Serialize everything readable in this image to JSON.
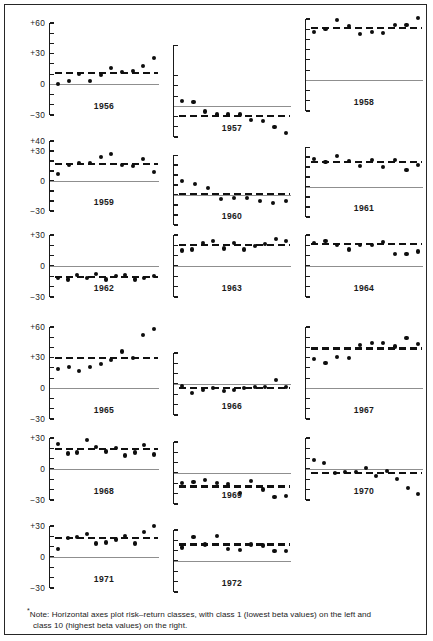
{
  "figure": {
    "footnote_marker": "*",
    "footnote_line1": "Note:  Horizontal axes plot risk–return classes, with class 1 (lowest beta values) on the left and",
    "footnote_line2": "class 10 (highest beta values) on the right.",
    "border_color": "#262626",
    "dot_color": "#0d0d0d",
    "mean_line_color": "#111111",
    "zero_line_color": "#8f8f8f"
  },
  "chart_data": {
    "type": "scatter",
    "title": "",
    "subtitle": "",
    "xlabel": "Risk–return class (1 = lowest beta, 10 = highest beta)",
    "ylabel": "Percent return",
    "grid": false,
    "legend": "none",
    "x": [
      1,
      2,
      3,
      4,
      5,
      6,
      7,
      8,
      9,
      10
    ],
    "panels": [
      {
        "year": "1956",
        "ylim": [
          -30,
          60
        ],
        "ticks": [
          -30,
          -20,
          -10,
          0,
          10,
          20,
          30,
          40,
          50,
          60
        ],
        "tick_labels": [
          {
            "value": 60,
            "text": "+60"
          },
          {
            "value": 30,
            "text": "+30"
          },
          {
            "value": 0,
            "text": "0"
          },
          {
            "value": -30,
            "text": "−30"
          }
        ],
        "mean": 11,
        "values": [
          0,
          3,
          10,
          3,
          9,
          16,
          12,
          13,
          18,
          26
        ]
      },
      {
        "year": "1957",
        "ylim": [
          -30,
          60
        ],
        "ticks": [
          -30,
          -20,
          -10,
          0,
          10,
          20,
          30
        ],
        "tick_labels": [],
        "mean": -9,
        "values": [
          5,
          4,
          -5,
          -8,
          -8,
          -8,
          -13,
          -14,
          -20,
          -18,
          -25
        ],
        "values_final": [
          5,
          4,
          -5,
          -8,
          -8,
          -8,
          -13,
          -14,
          -20,
          -26
        ]
      },
      {
        "year": "1958",
        "ylim": [
          -30,
          60
        ],
        "ticks": [
          -30,
          -20,
          -10,
          0,
          10,
          20,
          30,
          40,
          50,
          60
        ],
        "tick_labels": [],
        "mean": 51,
        "values": [
          47,
          50,
          59,
          53,
          45,
          47,
          46,
          54,
          54,
          61
        ]
      },
      {
        "year": "1959",
        "ylim": [
          -30,
          40
        ],
        "ticks": [
          -30,
          -20,
          -10,
          0,
          10,
          20,
          30,
          40
        ],
        "tick_labels": [
          {
            "value": 40,
            "text": "+40"
          },
          {
            "value": 30,
            "text": "+30"
          },
          {
            "value": 0,
            "text": "0"
          },
          {
            "value": -30,
            "text": "−30"
          }
        ],
        "mean": 17,
        "values": [
          7,
          16,
          18,
          18,
          24,
          27,
          16,
          15,
          22,
          9,
          21
        ],
        "values_final": [
          7,
          16,
          18,
          18,
          24,
          27,
          16,
          15,
          22,
          9
        ]
      },
      {
        "year": "1960",
        "ylim": [
          -30,
          40
        ],
        "ticks": [
          -30,
          -20,
          -10,
          0,
          10,
          20,
          30
        ],
        "tick_labels": [],
        "mean": 1,
        "values": [
          14,
          11,
          7,
          -4,
          -3,
          -3,
          -6,
          -8,
          -6
        ]
      },
      {
        "year": "1961",
        "ylim": [
          -30,
          40
        ],
        "ticks": [
          -30,
          -20,
          -10,
          0,
          10,
          20,
          30
        ],
        "tick_labels": [],
        "mean": 25,
        "values": [
          28,
          25,
          31,
          26,
          21,
          27,
          20,
          27,
          17,
          22
        ]
      },
      {
        "year": "1962",
        "ylim": [
          -30,
          30
        ],
        "ticks": [
          -30,
          -20,
          -10,
          0,
          10,
          20,
          30
        ],
        "tick_labels": [
          {
            "value": 30,
            "text": "+30"
          },
          {
            "value": 0,
            "text": "0"
          },
          {
            "value": -30,
            "text": "−30"
          }
        ],
        "mean": -11,
        "values": [
          -12,
          -13,
          -9,
          -12,
          -8,
          -13,
          -10,
          -9,
          -13,
          -12,
          -10
        ]
      },
      {
        "year": "1963",
        "ylim": [
          -30,
          30
        ],
        "ticks": [
          -30,
          -20,
          -10,
          0,
          10,
          20,
          30
        ],
        "tick_labels": [],
        "mean": 20,
        "values": [
          15,
          16,
          22,
          24,
          17,
          22,
          16,
          19,
          21,
          26,
          24
        ]
      },
      {
        "year": "1964",
        "ylim": [
          -30,
          30
        ],
        "ticks": [
          -30,
          -20,
          -10,
          0,
          10,
          20,
          30
        ],
        "tick_labels": [],
        "mean": 21,
        "values": [
          22,
          24,
          20,
          16,
          20,
          20,
          23,
          12,
          12,
          14
        ]
      },
      {
        "year": "1965",
        "ylim": [
          -30,
          60
        ],
        "ticks": [
          -30,
          -20,
          -10,
          0,
          10,
          20,
          30,
          40,
          50,
          60
        ],
        "tick_labels": [
          {
            "value": 60,
            "text": "+60"
          },
          {
            "value": 30,
            "text": "+30"
          },
          {
            "value": 0,
            "text": "0"
          },
          {
            "value": -30,
            "text": "−30"
          }
        ],
        "mean": 30,
        "values": [
          19,
          21,
          17,
          21,
          24,
          28,
          36,
          30,
          52,
          58
        ]
      },
      {
        "year": "1966",
        "ylim": [
          -30,
          30
        ],
        "ticks": [
          -30,
          -20,
          -10,
          0,
          10,
          20,
          30
        ],
        "tick_labels": [],
        "mean": -4,
        "values": [
          -2,
          -9,
          -6,
          -4,
          -7,
          -6,
          -4,
          -3,
          -3,
          4,
          -3
        ]
      },
      {
        "year": "1967",
        "ylim": [
          -30,
          60
        ],
        "ticks": [
          -30,
          -20,
          -10,
          0,
          10,
          20,
          30,
          40,
          50,
          60
        ],
        "tick_labels": [],
        "mean": 39,
        "values": [
          29,
          25,
          31,
          30,
          42,
          44,
          44,
          41,
          49,
          43
        ]
      },
      {
        "year": "1968",
        "ylim": [
          -30,
          30
        ],
        "ticks": [
          -30,
          -20,
          -10,
          0,
          10,
          20,
          30
        ],
        "tick_labels": [
          {
            "value": 30,
            "text": "+30"
          },
          {
            "value": 0,
            "text": "0"
          },
          {
            "value": -30,
            "text": "−30"
          }
        ],
        "mean": 19,
        "values": [
          24,
          15,
          16,
          28,
          21,
          17,
          20,
          13,
          16,
          23,
          14
        ]
      },
      {
        "year": "1969",
        "ylim": [
          -30,
          30
        ],
        "ticks": [
          -30,
          -20,
          -10,
          0,
          10,
          20,
          30
        ],
        "tick_labels": [],
        "mean": -13,
        "values": [
          -10,
          -9,
          -7,
          -10,
          -11,
          -19,
          -8,
          -16,
          -23,
          -22
        ]
      },
      {
        "year": "1970",
        "ylim": [
          -30,
          30
        ],
        "ticks": [
          -30,
          -20,
          -10,
          0,
          10,
          20,
          30
        ],
        "tick_labels": [],
        "mean": -4,
        "values": [
          9,
          6,
          -4,
          -3,
          -3,
          1,
          -7,
          -2,
          -10,
          -18,
          -24
        ]
      },
      {
        "year": "1971",
        "ylim": [
          -30,
          30
        ],
        "ticks": [
          -30,
          -20,
          -10,
          0,
          10,
          20,
          30
        ],
        "tick_labels": [
          {
            "value": 30,
            "text": "+30"
          },
          {
            "value": 0,
            "text": "0"
          },
          {
            "value": -30,
            "text": "−30"
          }
        ],
        "mean": 18,
        "values": [
          8,
          18,
          19,
          22,
          13,
          14,
          17,
          20,
          13,
          24,
          30
        ]
      },
      {
        "year": "1972",
        "ylim": [
          -30,
          30
        ],
        "ticks": [
          -30,
          -20,
          -10,
          0,
          10,
          20,
          30
        ],
        "tick_labels": [],
        "mean": 16,
        "values": [
          13,
          23,
          16,
          24,
          12,
          11,
          16,
          15,
          10,
          10
        ]
      }
    ]
  }
}
